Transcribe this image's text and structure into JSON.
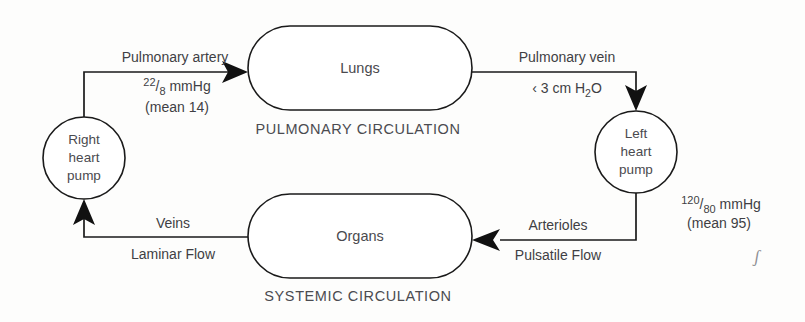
{
  "diagram": {
    "background_color": "#fdfdfc",
    "ink_color": "#1a1a1a",
    "text_color": "#3f3f44",
    "nodes": {
      "right_heart": {
        "line1": "Right",
        "line2": "heart",
        "line3": "pump"
      },
      "left_heart": {
        "line1": "Left",
        "line2": "heart",
        "line3": "pump"
      },
      "lungs": {
        "label": "Lungs"
      },
      "organs": {
        "label": "Organs"
      }
    },
    "captions": {
      "pulmonary": "PULMONARY CIRCULATION",
      "systemic": "SYSTEMIC CIRCULATION"
    },
    "edges": {
      "pulmonary_artery": {
        "name": "Pulmonary artery",
        "pressure_sup": "22",
        "pressure_slash": "/",
        "pressure_sub": "8",
        "pressure_unit": " mmHg",
        "mean": "(mean 14)"
      },
      "pulmonary_vein": {
        "name": "Pulmonary vein",
        "pressure_prefix": "‹ 3 cm H",
        "pressure_sub": "2",
        "pressure_suffix": "O"
      },
      "arterioles": {
        "name": "Arterioles",
        "flow": "Pulsatile Flow"
      },
      "veins": {
        "name": "Veins",
        "flow": "Laminar Flow"
      },
      "systemic_pressure": {
        "pressure_sup": "120",
        "pressure_slash": "/",
        "pressure_sub": "80",
        "pressure_unit": " mmHg",
        "mean": "(mean 95)"
      }
    },
    "marks": {
      "stray_pen_mark": "ʃ"
    }
  }
}
